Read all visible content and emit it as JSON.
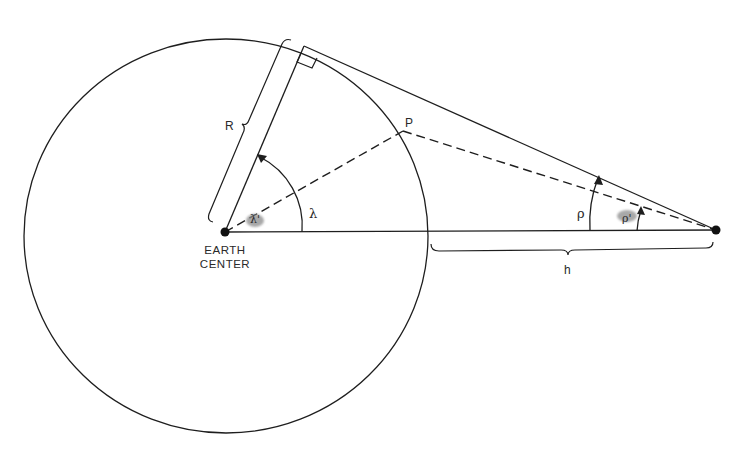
{
  "diagram": {
    "type": "geometry",
    "colors": {
      "line": "#1e1e1e",
      "background": "#ffffff",
      "smudge": "#8c8c8c"
    },
    "labels": {
      "radius": "R",
      "point": "P",
      "central_angle": "λ",
      "central_angle_max": "λ'",
      "nadir_angle": "ρ",
      "nadir_angle_to_p": "ρ'",
      "altitude": "h",
      "earth_center_line1": "EARTH",
      "earth_center_line2": "CENTER"
    },
    "nodes": [
      {
        "id": "earth-center",
        "label": "EARTH CENTER"
      },
      {
        "id": "satellite",
        "label": ""
      },
      {
        "id": "tangent-point",
        "label": ""
      },
      {
        "id": "point-p",
        "label": "P"
      }
    ],
    "edges": [
      {
        "from": "earth-center",
        "to": "satellite",
        "style": "solid"
      },
      {
        "from": "earth-center",
        "to": "tangent-point",
        "style": "solid",
        "label": "R"
      },
      {
        "from": "tangent-point",
        "to": "satellite",
        "style": "solid"
      },
      {
        "from": "earth-center",
        "to": "point-p",
        "style": "dashed"
      },
      {
        "from": "point-p",
        "to": "satellite",
        "style": "dashed"
      }
    ]
  }
}
